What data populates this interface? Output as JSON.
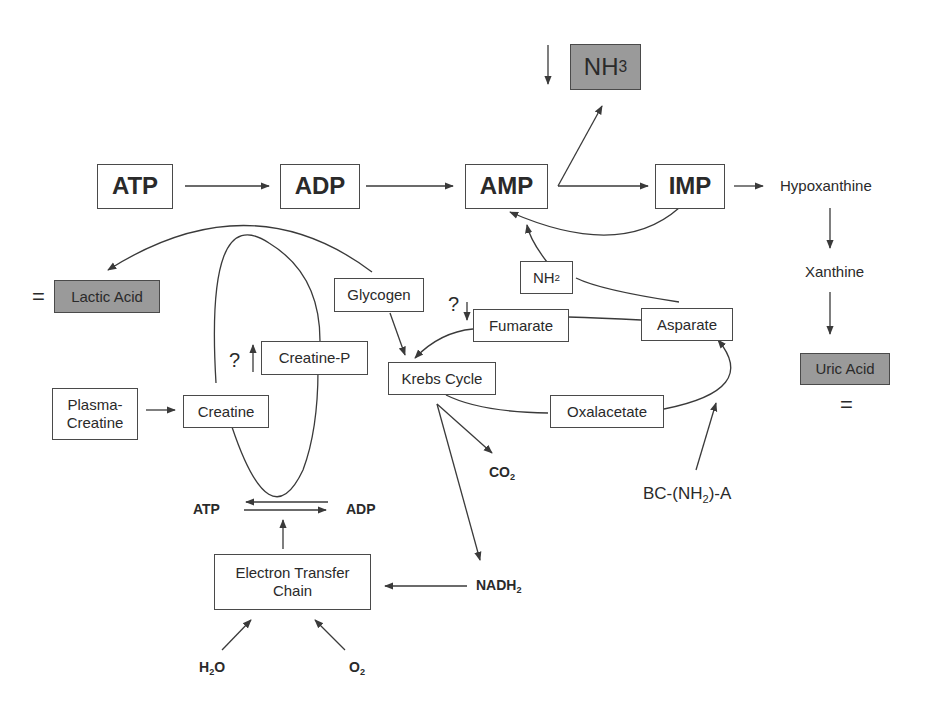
{
  "nodes": {
    "nh3": {
      "main": "NH",
      "sub": "3"
    },
    "atp": "ATP",
    "adp": "ADP",
    "amp": "AMP",
    "imp": "IMP",
    "hypoxanthine": "Hypoxanthine",
    "xanthine": "Xanthine",
    "uric_acid": "Uric Acid",
    "lactic_acid": "Lactic Acid",
    "glycogen": "Glycogen",
    "nh2": {
      "main": "NH",
      "sub": "2"
    },
    "fumarate": "Fumarate",
    "asparate": "Asparate",
    "creatine_p": "Creatine-P",
    "krebs_cycle": "Krebs Cycle",
    "plasma_creatine": {
      "line1": "Plasma-",
      "line2": "Creatine"
    },
    "creatine": "Creatine",
    "oxalacetate": "Oxalacetate",
    "co2": {
      "main": "CO",
      "sub": "2"
    },
    "bcaa": {
      "pre": "BC-(NH",
      "sub": "2",
      "post": ")-A"
    },
    "atp_small": "ATP",
    "adp_small": "ADP",
    "etc": {
      "line1": "Electron Transfer",
      "line2": "Chain"
    },
    "nadh2": {
      "main": "NADH",
      "sub": "2"
    },
    "h2o": {
      "pre": "H",
      "sub": "2",
      "post": "O"
    },
    "o2": {
      "main": "O",
      "sub": "2"
    }
  },
  "annotations": {
    "nh3_trend": "↓",
    "lactic_equal": "=",
    "uric_equal": "=",
    "creatine_p_question": "?",
    "creatine_p_trend": "↑",
    "fumarate_question": "?",
    "fumarate_trend": "↓"
  },
  "colors": {
    "line": "#3a3a3a",
    "shaded_box": "#9a9a9a",
    "text": "#2a2a2a"
  }
}
